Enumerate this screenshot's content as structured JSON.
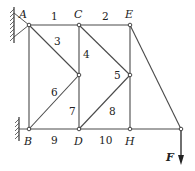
{
  "diagram": {
    "type": "plane truss",
    "nodes": [
      {
        "id": "A",
        "label": "A",
        "x": 29,
        "y": 25,
        "lx": 19,
        "ly": 18
      },
      {
        "id": "C",
        "label": "C",
        "x": 79,
        "y": 25,
        "lx": 74,
        "ly": 18
      },
      {
        "id": "E",
        "label": "E",
        "x": 130,
        "y": 25,
        "lx": 125,
        "ly": 18
      },
      {
        "id": "B",
        "label": "B",
        "x": 29,
        "y": 129,
        "lx": 24,
        "ly": 145
      },
      {
        "id": "D",
        "label": "D",
        "x": 79,
        "y": 129,
        "lx": 74,
        "ly": 145
      },
      {
        "id": "H",
        "label": "H",
        "x": 130,
        "y": 129,
        "lx": 125,
        "ly": 145
      },
      {
        "id": "M1",
        "label": "",
        "x": 79,
        "y": 75
      },
      {
        "id": "M2",
        "label": "",
        "x": 130,
        "y": 75
      },
      {
        "id": "T",
        "label": "",
        "x": 181,
        "y": 129
      }
    ],
    "members": [
      {
        "id": "1",
        "from": "A",
        "to": "C",
        "lx": 51,
        "ly": 20
      },
      {
        "id": "2",
        "from": "C",
        "to": "E",
        "lx": 102,
        "ly": 20
      },
      {
        "id": "3",
        "from": "A",
        "to": "M1",
        "lx": 54,
        "ly": 45
      },
      {
        "id": "4",
        "from": "C",
        "to": "M1",
        "lx": 83,
        "ly": 58
      },
      {
        "id": "5",
        "from": "C",
        "to": "M2",
        "lx": 114,
        "ly": 79
      },
      {
        "id": "6",
        "from": "B",
        "to": "M1",
        "lx": 51,
        "ly": 96
      },
      {
        "id": "7",
        "from": "M1",
        "to": "D",
        "lx": 69,
        "ly": 115
      },
      {
        "id": "8",
        "from": "D",
        "to": "M2",
        "lx": 109,
        "ly": 115
      },
      {
        "id": "9",
        "from": "B",
        "to": "D",
        "lx": 51,
        "ly": 144
      },
      {
        "id": "10",
        "from": "D",
        "to": "H",
        "lx": 99,
        "ly": 144
      },
      {
        "id": "AB",
        "from": "A",
        "to": "B",
        "lx": null,
        "ly": null
      },
      {
        "id": "EM2",
        "from": "E",
        "to": "M2",
        "lx": null,
        "ly": null
      },
      {
        "id": "M2H",
        "from": "M2",
        "to": "H",
        "lx": null,
        "ly": null
      },
      {
        "id": "HT",
        "from": "H",
        "to": "T",
        "lx": null,
        "ly": null
      },
      {
        "id": "ET",
        "from": "E",
        "to": "T",
        "lx": null,
        "ly": null
      }
    ],
    "supports": [
      {
        "node": "A",
        "type": "pin-to-wall",
        "side": "left"
      },
      {
        "node": "B",
        "type": "pin-to-wall",
        "side": "left"
      }
    ],
    "loads": [
      {
        "node": "T",
        "label": "F",
        "direction": "down",
        "label_x": 166,
        "label_y": 161
      }
    ],
    "colors": {
      "member": "#4a4a4a",
      "text": "#222222",
      "background": "#ffffff"
    }
  }
}
